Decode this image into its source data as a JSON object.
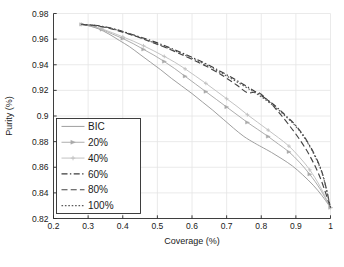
{
  "chart_data": {
    "type": "line",
    "title": "",
    "xlabel": "Coverage (%)",
    "ylabel": "Purity (%)",
    "xlim": [
      0.2,
      1.0
    ],
    "ylim": [
      0.82,
      0.98
    ],
    "xticks": [
      "0.2",
      "0.3",
      "0.4",
      "0.5",
      "0.6",
      "0.7",
      "0.8",
      "0.9",
      "1"
    ],
    "xtick_values": [
      0.2,
      0.3,
      0.4,
      0.5,
      0.6,
      0.7,
      0.8,
      0.9,
      1.0
    ],
    "yticks": [
      "0.82",
      "0.84",
      "0.86",
      "0.88",
      "0.9",
      "0.92",
      "0.94",
      "0.96",
      "0.98"
    ],
    "ytick_values": [
      0.82,
      0.84,
      0.86,
      0.88,
      0.9,
      0.92,
      0.94,
      0.96,
      0.98
    ],
    "grid": true,
    "legend_position": "center-left",
    "series": [
      {
        "name": "BIC",
        "style": "solid",
        "marker": "none",
        "color": "#9a9a9a",
        "points": [
          [
            0.281,
            0.9715
          ],
          [
            0.3,
            0.9705
          ],
          [
            0.33,
            0.968
          ],
          [
            0.36,
            0.964
          ],
          [
            0.39,
            0.959
          ],
          [
            0.42,
            0.954
          ],
          [
            0.45,
            0.948
          ],
          [
            0.48,
            0.942
          ],
          [
            0.51,
            0.936
          ],
          [
            0.54,
            0.9295
          ],
          [
            0.57,
            0.9235
          ],
          [
            0.6,
            0.9175
          ],
          [
            0.63,
            0.911
          ],
          [
            0.66,
            0.9045
          ],
          [
            0.69,
            0.8975
          ],
          [
            0.72,
            0.8905
          ],
          [
            0.75,
            0.884
          ],
          [
            0.78,
            0.879
          ],
          [
            0.8,
            0.876
          ],
          [
            0.83,
            0.8715
          ],
          [
            0.86,
            0.8665
          ],
          [
            0.89,
            0.861
          ],
          [
            0.92,
            0.854
          ],
          [
            0.95,
            0.846
          ],
          [
            0.975,
            0.838
          ],
          [
            1.0,
            0.8285
          ]
        ]
      },
      {
        "name": "20%",
        "style": "solid",
        "marker": "triangle",
        "color": "#a9a9a9",
        "points": [
          [
            0.281,
            0.9715
          ],
          [
            0.31,
            0.97
          ],
          [
            0.34,
            0.9675
          ],
          [
            0.37,
            0.964
          ],
          [
            0.4,
            0.9605
          ],
          [
            0.43,
            0.9565
          ],
          [
            0.46,
            0.952
          ],
          [
            0.49,
            0.9475
          ],
          [
            0.52,
            0.9425
          ],
          [
            0.55,
            0.937
          ],
          [
            0.58,
            0.931
          ],
          [
            0.61,
            0.925
          ],
          [
            0.64,
            0.919
          ],
          [
            0.67,
            0.913
          ],
          [
            0.7,
            0.907
          ],
          [
            0.73,
            0.901
          ],
          [
            0.76,
            0.895
          ],
          [
            0.79,
            0.8895
          ],
          [
            0.82,
            0.884
          ],
          [
            0.85,
            0.878
          ],
          [
            0.88,
            0.872
          ],
          [
            0.91,
            0.864
          ],
          [
            0.94,
            0.8545
          ],
          [
            0.97,
            0.843
          ],
          [
            1.0,
            0.8285
          ]
        ]
      },
      {
        "name": "40%",
        "style": "solid",
        "marker": "plus",
        "color": "#c0c0c0",
        "points": [
          [
            0.281,
            0.9715
          ],
          [
            0.31,
            0.9705
          ],
          [
            0.34,
            0.968
          ],
          [
            0.37,
            0.965
          ],
          [
            0.4,
            0.9618
          ],
          [
            0.43,
            0.9585
          ],
          [
            0.46,
            0.9548
          ],
          [
            0.49,
            0.9508
          ],
          [
            0.52,
            0.9465
          ],
          [
            0.55,
            0.942
          ],
          [
            0.58,
            0.9368
          ],
          [
            0.61,
            0.9312
          ],
          [
            0.64,
            0.9255
          ],
          [
            0.67,
            0.9195
          ],
          [
            0.7,
            0.9135
          ],
          [
            0.73,
            0.9075
          ],
          [
            0.76,
            0.901
          ],
          [
            0.79,
            0.895
          ],
          [
            0.82,
            0.889
          ],
          [
            0.85,
            0.883
          ],
          [
            0.88,
            0.8765
          ],
          [
            0.91,
            0.868
          ],
          [
            0.94,
            0.858
          ],
          [
            0.97,
            0.845
          ],
          [
            1.0,
            0.8285
          ]
        ]
      },
      {
        "name": "60%",
        "style": "dashdot",
        "marker": "none",
        "color": "#3c3c3c",
        "points": [
          [
            0.281,
            0.9715
          ],
          [
            0.32,
            0.9708
          ],
          [
            0.36,
            0.969
          ],
          [
            0.4,
            0.966
          ],
          [
            0.44,
            0.9625
          ],
          [
            0.48,
            0.959
          ],
          [
            0.52,
            0.955
          ],
          [
            0.56,
            0.9505
          ],
          [
            0.6,
            0.9458
          ],
          [
            0.64,
            0.9408
          ],
          [
            0.68,
            0.9352
          ],
          [
            0.72,
            0.9292
          ],
          [
            0.76,
            0.9228
          ],
          [
            0.8,
            0.916
          ],
          [
            0.84,
            0.908
          ],
          [
            0.87,
            0.9005
          ],
          [
            0.9,
            0.8925
          ],
          [
            0.93,
            0.8815
          ],
          [
            0.96,
            0.8665
          ],
          [
            0.98,
            0.852
          ],
          [
            1.0,
            0.8285
          ]
        ]
      },
      {
        "name": "80%",
        "style": "dashed",
        "marker": "none",
        "color": "#444444",
        "points": [
          [
            0.281,
            0.9715
          ],
          [
            0.32,
            0.9705
          ],
          [
            0.36,
            0.9685
          ],
          [
            0.4,
            0.9655
          ],
          [
            0.44,
            0.962
          ],
          [
            0.48,
            0.958
          ],
          [
            0.52,
            0.9538
          ],
          [
            0.56,
            0.9492
          ],
          [
            0.6,
            0.9442
          ],
          [
            0.64,
            0.939
          ],
          [
            0.68,
            0.933
          ],
          [
            0.7,
            0.9295
          ],
          [
            0.73,
            0.924
          ],
          [
            0.76,
            0.9182
          ],
          [
            0.79,
            0.9185
          ],
          [
            0.82,
            0.912
          ],
          [
            0.85,
            0.903
          ],
          [
            0.88,
            0.893
          ],
          [
            0.91,
            0.882
          ],
          [
            0.94,
            0.869
          ],
          [
            0.97,
            0.852
          ],
          [
            1.0,
            0.8285
          ]
        ]
      },
      {
        "name": "100%",
        "style": "dotted",
        "marker": "none",
        "color": "#5a5a5a",
        "points": [
          [
            0.281,
            0.9715
          ],
          [
            0.32,
            0.9706
          ],
          [
            0.36,
            0.9688
          ],
          [
            0.4,
            0.9658
          ],
          [
            0.44,
            0.9622
          ],
          [
            0.48,
            0.9582
          ],
          [
            0.52,
            0.9542
          ],
          [
            0.56,
            0.9498
          ],
          [
            0.6,
            0.945
          ],
          [
            0.64,
            0.94
          ],
          [
            0.68,
            0.9342
          ],
          [
            0.72,
            0.9282
          ],
          [
            0.76,
            0.9218
          ],
          [
            0.8,
            0.915
          ],
          [
            0.84,
            0.907
          ],
          [
            0.87,
            0.8998
          ],
          [
            0.9,
            0.8918
          ],
          [
            0.93,
            0.8808
          ],
          [
            0.96,
            0.8658
          ],
          [
            0.98,
            0.8515
          ],
          [
            1.0,
            0.8285
          ]
        ]
      }
    ]
  },
  "legend": {
    "entries": [
      {
        "label": "BIC"
      },
      {
        "label": "20%"
      },
      {
        "label": "40%"
      },
      {
        "label": "60%"
      },
      {
        "label": "80%"
      },
      {
        "label": "100%"
      }
    ]
  },
  "colors": {
    "axis": "#2b2b2b",
    "grid": "#e4e4e4",
    "background": "#ffffff",
    "text": "#1a1a1a"
  }
}
